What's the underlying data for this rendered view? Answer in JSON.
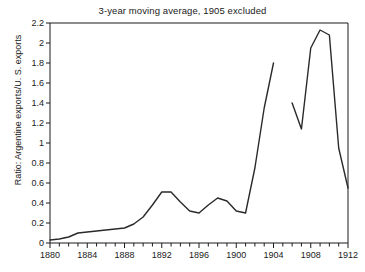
{
  "chart_data": {
    "type": "line",
    "title": "3-year moving average, 1905 excluded",
    "xlabel": "",
    "ylabel": "Ratio: Argentine exports/U. S. exports",
    "xlim": [
      1880,
      1912
    ],
    "ylim": [
      0,
      2.2
    ],
    "grid": false,
    "legend": "none",
    "xticks_labeled": [
      "1880",
      "1884",
      "1888",
      "1892",
      "1896",
      "1900",
      "1904",
      "1908",
      "1912"
    ],
    "xtick_step_minor": 1,
    "yticks": [
      "0",
      "0.2",
      "0.4",
      "0.6",
      "0.8",
      "1",
      "1.2",
      "1.4",
      "1.6",
      "1.8",
      "2",
      "2.2"
    ],
    "series": [
      {
        "name": "Ratio of Argentine exports to U. S. exports (3-year moving average)",
        "segment": "1880-1904",
        "x": [
          1880,
          1881,
          1882,
          1883,
          1884,
          1885,
          1886,
          1887,
          1888,
          1889,
          1890,
          1891,
          1892,
          1893,
          1894,
          1895,
          1896,
          1897,
          1898,
          1899,
          1900,
          1901,
          1902,
          1903,
          1904
        ],
        "values": [
          0.03,
          0.04,
          0.06,
          0.1,
          0.11,
          0.12,
          0.13,
          0.14,
          0.15,
          0.19,
          0.26,
          0.38,
          0.51,
          0.51,
          0.41,
          0.32,
          0.3,
          0.38,
          0.45,
          0.42,
          0.32,
          0.3,
          0.75,
          1.35,
          1.8
        ]
      },
      {
        "name": "Ratio of Argentine exports to U. S. exports (3-year moving average)",
        "segment": "1906-1912",
        "x": [
          1906,
          1907,
          1908,
          1909,
          1910,
          1911,
          1912
        ],
        "values": [
          1.4,
          1.14,
          1.95,
          2.13,
          2.08,
          0.95,
          0.55
        ]
      }
    ],
    "annotations": [
      "1905 excluded from the moving average, producing a break in the line"
    ],
    "colors": {
      "line": "#2a2a2a",
      "axis": "#1a1a1a",
      "background": "#ffffff"
    }
  }
}
